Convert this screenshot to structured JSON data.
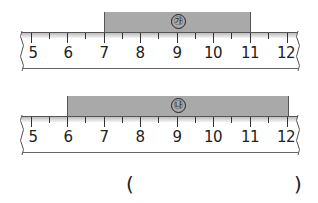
{
  "figures": [
    {
      "id": "ga",
      "label": "㉮",
      "bar": {
        "start": 7,
        "end": 11
      },
      "ruler": {
        "min": 5,
        "max": 12,
        "ticks": [
          "5",
          "6",
          "7",
          "8",
          "9",
          "10",
          "11",
          "12"
        ]
      }
    },
    {
      "id": "na",
      "label": "㉯",
      "bar": {
        "start": 6,
        "end": 12
      },
      "ruler": {
        "min": 5,
        "max": 12,
        "ticks": [
          "5",
          "6",
          "7",
          "8",
          "9",
          "10",
          "11",
          "12"
        ]
      }
    }
  ],
  "answer": {
    "open_paren": "(",
    "close_paren": ")",
    "value": ""
  },
  "colors": {
    "bar_fill": "#a9a9a9",
    "ruler_line": "#555555",
    "text": "#222222"
  }
}
